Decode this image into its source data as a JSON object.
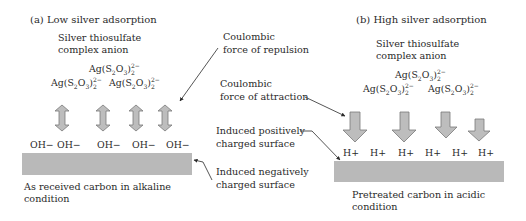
{
  "panel_a": {
    "title": "(a) Low silver adsorption",
    "complex_label_1": "Silver thiosulfate",
    "complex_label_2": "complex anion",
    "anion_formula": "Ag(S2O3)2 2−",
    "anion_count": 3,
    "surface_ions": [
      "OH−",
      "OH−",
      "OH−",
      "OH−",
      "OH−"
    ],
    "surface_label_1": "As received carbon in alkaline",
    "surface_label_2": "condition",
    "arrow_type": "double-headed (repulsion)",
    "arrow_count": 4
  },
  "panel_b": {
    "title": "(b) High silver adsorption",
    "complex_label_1": "Silver thiosulfate",
    "complex_label_2": "complex anion",
    "anion_formula": "Ag(S2O3)2 2−",
    "anion_count": 3,
    "surface_ions": [
      "H+",
      "H+",
      "H+",
      "H+",
      "H+",
      "H+"
    ],
    "surface_label_1": "Pretreated carbon in acidic",
    "surface_label_2": "condition",
    "arrow_type": "downward (attraction)",
    "arrow_count": 4
  },
  "annotations": {
    "repulsion_1": "Coulombic",
    "repulsion_2": "force of repulsion",
    "attraction_1": "Coulombic",
    "attraction_2": "force of attraction",
    "positive_1": "Induced positively",
    "positive_2": "charged surface",
    "negative_1": "Induced negatively",
    "negative_2": "charged surface"
  },
  "formula_parts": {
    "ag": "Ag(S",
    "s_sub": "2",
    "o": "O",
    "o_sub": "3",
    "close": ")",
    "charge": "2−",
    "count": "2"
  },
  "colors": {
    "surface": "#b9b9b9",
    "arrow_fill": "#bdbdbd",
    "arrow_stroke": "#7a7a7a",
    "text": "#2a2a2a"
  }
}
